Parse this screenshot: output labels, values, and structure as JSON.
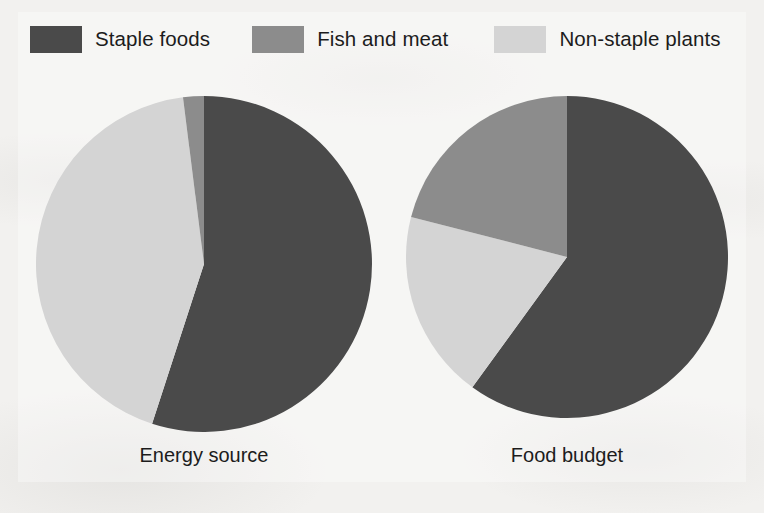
{
  "legend": {
    "items": [
      {
        "label": "Staple foods",
        "color": "#4a4a4a",
        "key": "staple_foods"
      },
      {
        "label": "Fish and meat",
        "color": "#8c8c8c",
        "key": "fish_and_meat"
      },
      {
        "label": "Non-staple plants",
        "color": "#d4d4d4",
        "key": "non_staple_plants"
      }
    ]
  },
  "captions": {
    "left": "Energy source",
    "right": "Food budget"
  },
  "colors": {
    "staple_foods": "#4a4a4a",
    "fish_and_meat": "#8c8c8c",
    "non_staple_plants": "#d4d4d4",
    "background": "#f2f1ef",
    "text": "#1c1c1c"
  },
  "chart_data": {
    "type": "pie",
    "title": "",
    "legend_position": "top",
    "legend_entries": [
      "Staple foods",
      "Fish and meat",
      "Non-staple plants"
    ],
    "charts": [
      {
        "title": "Energy source",
        "type": "pie",
        "start_angle_deg": 0,
        "direction": "clockwise",
        "categories": [
          "Staple foods",
          "Non-staple plants",
          "Fish and meat"
        ],
        "values": [
          55,
          43,
          2
        ],
        "units": "percent",
        "slices": [
          {
            "label": "Staple foods",
            "value": 55,
            "color": "#4a4a4a"
          },
          {
            "label": "Non-staple plants",
            "value": 43,
            "color": "#d4d4d4"
          },
          {
            "label": "Fish and meat",
            "value": 2,
            "color": "#8c8c8c"
          }
        ]
      },
      {
        "title": "Food budget",
        "type": "pie",
        "start_angle_deg": 0,
        "direction": "clockwise",
        "categories": [
          "Staple foods",
          "Non-staple plants",
          "Fish and meat"
        ],
        "values": [
          60,
          19,
          21
        ],
        "units": "percent",
        "slices": [
          {
            "label": "Staple foods",
            "value": 60,
            "color": "#4a4a4a"
          },
          {
            "label": "Non-staple plants",
            "value": 19,
            "color": "#d4d4d4"
          },
          {
            "label": "Fish and meat",
            "value": 21,
            "color": "#8c8c8c"
          }
        ]
      }
    ]
  }
}
